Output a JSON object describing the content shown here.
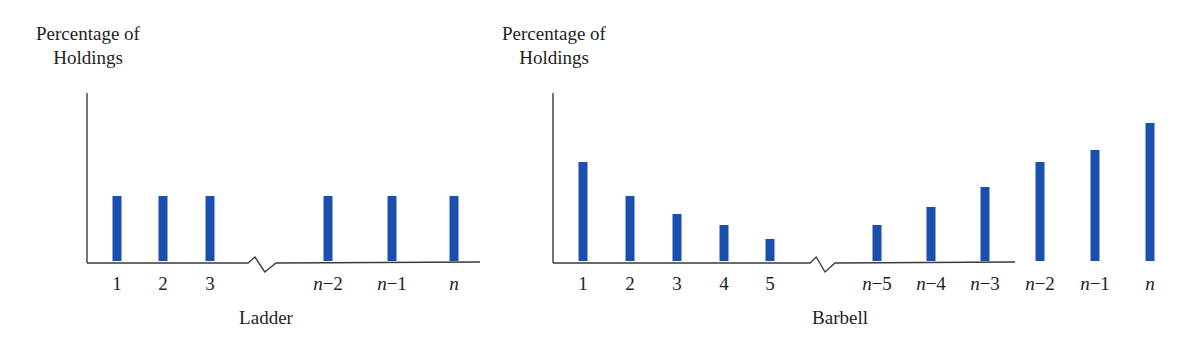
{
  "colors": {
    "bar": "#1a4fb0",
    "axis": "#3a3a3a",
    "text": "#231f20"
  },
  "chart_data": [
    {
      "type": "bar",
      "title": "Ladder",
      "xlabel": "Ladder",
      "ylabel": "Percentage of Holdings",
      "ylabel_lines": [
        "Percentage of",
        "Holdings"
      ],
      "categories": [
        "1",
        "2",
        "3",
        "n−2",
        "n−1",
        "n"
      ],
      "values": [
        65,
        65,
        65,
        65,
        65,
        65
      ],
      "axis_break_after_index": 2,
      "grid": false,
      "legend": null,
      "note": "Relative heights (unitless); equal allocation across maturities"
    },
    {
      "type": "bar",
      "title": "Barbell",
      "xlabel": "Barbell",
      "ylabel": "Percentage of Holdings",
      "ylabel_lines": [
        "Percentage of",
        "Holdings"
      ],
      "categories": [
        "1",
        "2",
        "3",
        "4",
        "5",
        "n−5",
        "n−4",
        "n−3",
        "n−2",
        "n−1",
        "n"
      ],
      "values": [
        99,
        65,
        47,
        36,
        22,
        36,
        54,
        74,
        99,
        111,
        138
      ],
      "axis_break_after_index": 4,
      "grid": false,
      "legend": null,
      "note": "Relative heights (unitless); holdings concentrated at short and long ends"
    }
  ],
  "layout": {
    "baseline_y": 261,
    "bar_width": 9,
    "ladder": {
      "y_axis_x": 87,
      "y_axis_top": 93,
      "x_axis_end": 480,
      "break": [
        248,
        276
      ],
      "bar_x": [
        117,
        163,
        210,
        328,
        392,
        454
      ],
      "italic": [
        false,
        false,
        false,
        true,
        true,
        true
      ]
    },
    "barbell": {
      "y_axis_x": 553,
      "y_axis_top": 93,
      "x_axis_end": 1014,
      "break": [
        810,
        835
      ],
      "bar_x": [
        583,
        630,
        677,
        724,
        770,
        877,
        931,
        985,
        1040,
        1095,
        1150
      ],
      "italic": [
        false,
        false,
        false,
        false,
        false,
        true,
        true,
        true,
        true,
        true,
        true
      ]
    },
    "x_axis_end_barbell": 1015
  }
}
